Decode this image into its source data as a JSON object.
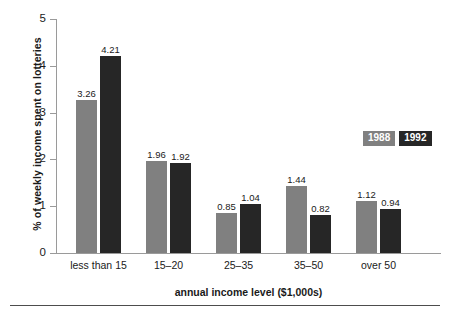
{
  "chart_data": {
    "type": "bar",
    "title": "",
    "xlabel": "annual income level ($1,000s)",
    "ylabel": "% of weekly income spent on lotteries",
    "categories": [
      "less than 15",
      "15–20",
      "25–35",
      "35–50",
      "over 50"
    ],
    "series": [
      {
        "name": "1988",
        "color": "#808080",
        "values": [
          3.26,
          1.96,
          0.85,
          1.44,
          1.12
        ]
      },
      {
        "name": "1992",
        "color": "#262626",
        "values": [
          4.21,
          1.92,
          1.04,
          0.82,
          0.94
        ]
      }
    ],
    "value_labels": {
      "1988": [
        "3.26",
        "1.96",
        "0.85",
        "1.44",
        "1.12"
      ],
      "1992": [
        "4.21",
        "1.92",
        "1.04",
        "0.82",
        "0.94"
      ]
    },
    "ylim": [
      0,
      5
    ],
    "yticks": [
      "0",
      "1",
      "2",
      "3",
      "4",
      "5"
    ],
    "grid": false,
    "legend_position": "right-middle"
  },
  "axes": {
    "y_title": "% of weekly income spent on lotteries",
    "x_title": "annual income level ($1,000s)",
    "y_ticks": [
      "5",
      "4",
      "3",
      "2",
      "1",
      "0"
    ],
    "x_categories": [
      "less than 15",
      "15–20",
      "25–35",
      "35–50",
      "over 50"
    ]
  },
  "legend": {
    "items": [
      {
        "label": "1988",
        "color": "#808080"
      },
      {
        "label": "1992",
        "color": "#262626"
      }
    ]
  },
  "bar_labels": [
    "3.26",
    "4.21",
    "1.96",
    "1.92",
    "0.85",
    "1.04",
    "1.44",
    "0.82",
    "1.12",
    "0.94"
  ],
  "colors": {
    "series_1988": "#808080",
    "series_1992": "#262626",
    "axis": "#9a9a9a",
    "text": "#1a1a1a",
    "rule": "#4d4d4d",
    "background": "#ffffff"
  }
}
